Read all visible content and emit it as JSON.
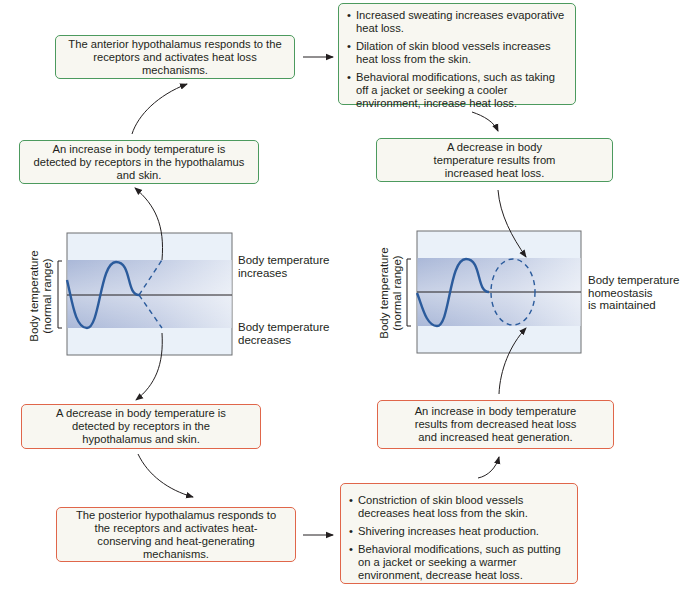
{
  "colors": {
    "heat_loss_border": "#4c9a5e",
    "heat_gain_border": "#e0664a",
    "box_fill": "#f8f7f1",
    "band_fill": "#b7c3de",
    "graph_bg": "#eaf1f9",
    "curve": "#2b5b9c"
  },
  "top_pathway": {
    "detect_increase": "An increase in body temperature is detected by receptors in the hypothalamus and skin.",
    "anterior_response": "The anterior hypothalamus responds to the receptors and activates heat loss mechanisms.",
    "heat_loss_mechanisms": [
      "Increased sweating increases evaporative heat loss.",
      "Dilation of skin blood vessels increases heat loss from the skin.",
      "Behavioral modifications, such as taking off a jacket or seeking a cooler environment, increase heat loss."
    ],
    "result_decrease": "A decrease in body temperature results from increased heat loss."
  },
  "bottom_pathway": {
    "detect_decrease": "A decrease in body temperature is detected by receptors in the hypothalamus and skin.",
    "posterior_response": "The posterior hypothalamus responds to the receptors and activates heat-conserving and heat-generating mechanisms.",
    "heat_conserve_mechanisms": [
      "Constriction of skin blood vessels decreases heat loss from the skin.",
      "Shivering increases heat production.",
      "Behavioral modifications, such as putting on a jacket or seeking a warmer environment, decrease heat loss."
    ],
    "result_increase": "An increase in body temperature results from decreased heat loss and increased heat generation."
  },
  "left_graph": {
    "y_axis_label_line1": "Body temperature",
    "y_axis_label_line2": "(normal range)",
    "label_increase_line1": "Body temperature",
    "label_increase_line2": "increases",
    "label_decrease_line1": "Body temperature",
    "label_decrease_line2": "decreases"
  },
  "right_graph": {
    "y_axis_label_line1": "Body temperature",
    "y_axis_label_line2": "(normal range)",
    "label_line1": "Body temperature",
    "label_line2": "homeostasis",
    "label_line3": "is maintained"
  }
}
